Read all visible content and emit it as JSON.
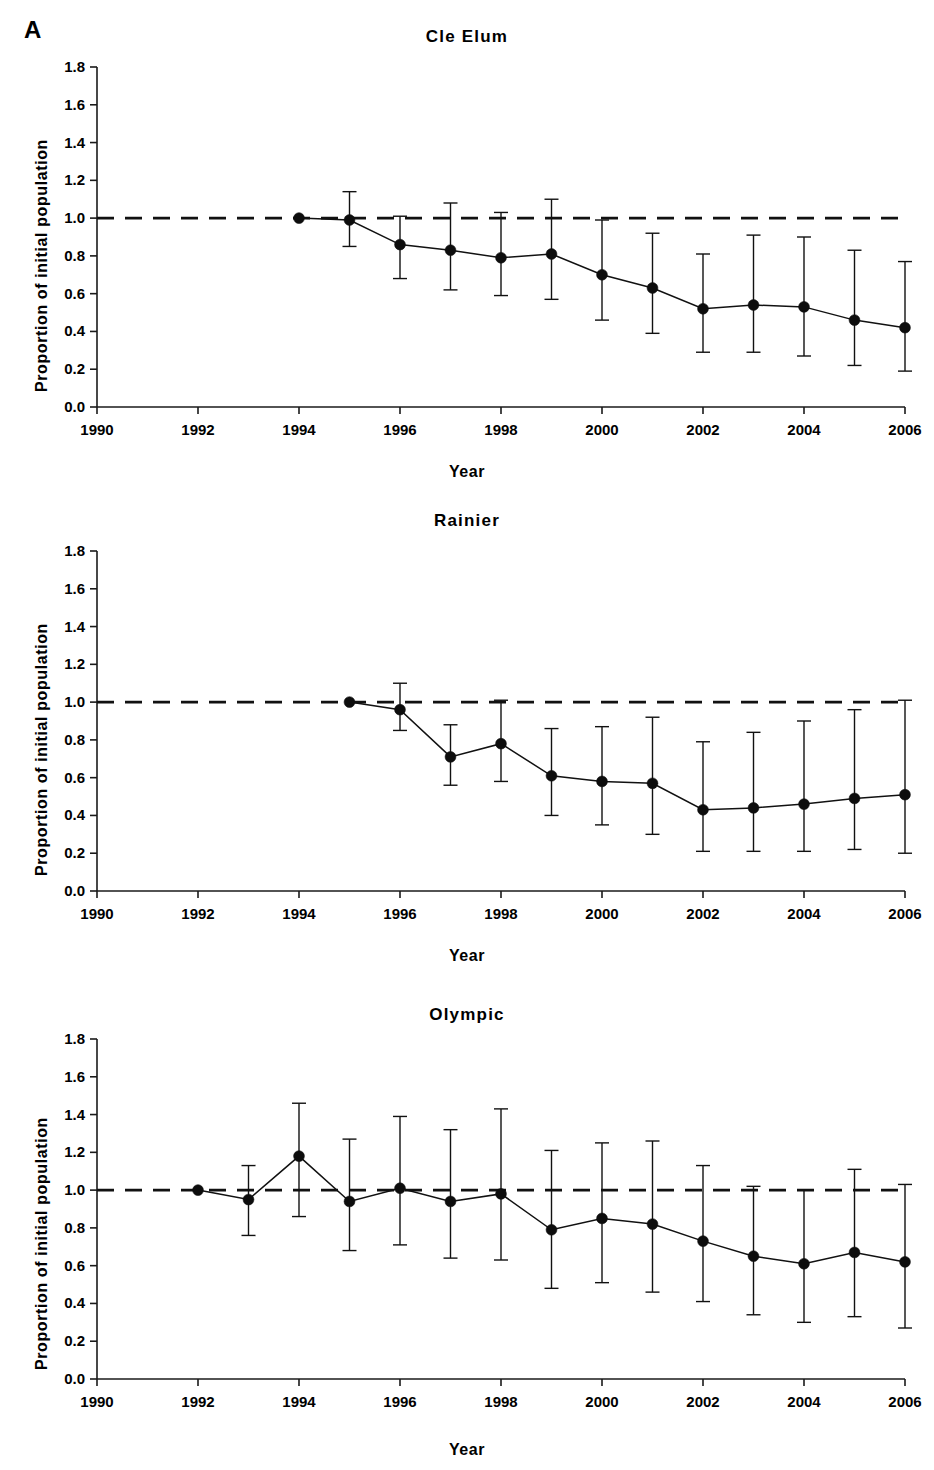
{
  "figure": {
    "panel_label": "A",
    "axis_titles": {
      "x": "Year",
      "y": "Proportion of initial population"
    },
    "y_ticks": [
      "0.0",
      "0.2",
      "0.4",
      "0.6",
      "0.8",
      "1.0",
      "1.2",
      "1.4",
      "1.6",
      "1.8"
    ],
    "x_ticks": [
      "1990",
      "1992",
      "1994",
      "1996",
      "1998",
      "2000",
      "2002",
      "2004",
      "2006"
    ],
    "reference_line_value": "1.0",
    "colors": {
      "ink": "#111111",
      "background": "#ffffff",
      "marker": "#0d0d0d"
    },
    "panels": [
      {
        "title": "Cle Elum"
      },
      {
        "title": "Rainier"
      },
      {
        "title": "Olympic"
      }
    ]
  },
  "chart_data": [
    {
      "type": "line",
      "title": "Cle Elum",
      "xlabel": "Year",
      "ylabel": "Proportion of initial population",
      "xlim": [
        1990,
        2006
      ],
      "ylim": [
        0.0,
        1.8
      ],
      "xticks": [
        1990,
        1992,
        1994,
        1996,
        1998,
        2000,
        2002,
        2004,
        2006
      ],
      "yticks": [
        0.0,
        0.2,
        0.4,
        0.6,
        0.8,
        1.0,
        1.2,
        1.4,
        1.6,
        1.8
      ],
      "grid": false,
      "legend": "none",
      "reference_line": {
        "y": 1.0,
        "style": "dashed"
      },
      "x": [
        1994,
        1995,
        1996,
        1997,
        1998,
        1999,
        2000,
        2001,
        2002,
        2003,
        2004,
        2005,
        2006
      ],
      "y": [
        1.0,
        0.99,
        0.86,
        0.83,
        0.79,
        0.81,
        0.7,
        0.63,
        0.52,
        0.54,
        0.53,
        0.46,
        0.42
      ],
      "y_err_low": [
        1.0,
        0.85,
        0.68,
        0.62,
        0.59,
        0.57,
        0.46,
        0.39,
        0.29,
        0.29,
        0.27,
        0.22,
        0.19
      ],
      "y_err_high": [
        1.0,
        1.14,
        1.01,
        1.08,
        1.03,
        1.1,
        0.99,
        0.92,
        0.81,
        0.91,
        0.9,
        0.83,
        0.77
      ]
    },
    {
      "type": "line",
      "title": "Rainier",
      "xlabel": "Year",
      "ylabel": "Proportion of initial population",
      "xlim": [
        1990,
        2006
      ],
      "ylim": [
        0.0,
        1.8
      ],
      "xticks": [
        1990,
        1992,
        1994,
        1996,
        1998,
        2000,
        2002,
        2004,
        2006
      ],
      "yticks": [
        0.0,
        0.2,
        0.4,
        0.6,
        0.8,
        1.0,
        1.2,
        1.4,
        1.6,
        1.8
      ],
      "grid": false,
      "legend": "none",
      "reference_line": {
        "y": 1.0,
        "style": "dashed"
      },
      "x": [
        1995,
        1996,
        1997,
        1998,
        1999,
        2000,
        2001,
        2002,
        2003,
        2004,
        2005,
        2006
      ],
      "y": [
        1.0,
        0.96,
        0.71,
        0.78,
        0.61,
        0.58,
        0.57,
        0.43,
        0.44,
        0.46,
        0.49,
        0.51
      ],
      "y_err_low": [
        1.0,
        0.85,
        0.56,
        0.58,
        0.4,
        0.35,
        0.3,
        0.21,
        0.21,
        0.21,
        0.22,
        0.2
      ],
      "y_err_high": [
        1.0,
        1.1,
        0.88,
        1.01,
        0.86,
        0.87,
        0.92,
        0.79,
        0.84,
        0.9,
        0.96,
        1.01
      ]
    },
    {
      "type": "line",
      "title": "Olympic",
      "xlabel": "Year",
      "ylabel": "Proportion of initial population",
      "xlim": [
        1990,
        2006
      ],
      "ylim": [
        0.0,
        1.8
      ],
      "xticks": [
        1990,
        1992,
        1994,
        1996,
        1998,
        2000,
        2002,
        2004,
        2006
      ],
      "yticks": [
        0.0,
        0.2,
        0.4,
        0.6,
        0.8,
        1.0,
        1.2,
        1.4,
        1.6,
        1.8
      ],
      "grid": false,
      "legend": "none",
      "reference_line": {
        "y": 1.0,
        "style": "dashed"
      },
      "x": [
        1992,
        1993,
        1994,
        1995,
        1996,
        1997,
        1998,
        1999,
        2000,
        2001,
        2002,
        2003,
        2004,
        2005,
        2006
      ],
      "y": [
        1.0,
        0.95,
        1.18,
        0.94,
        1.01,
        0.94,
        0.98,
        0.79,
        0.85,
        0.82,
        0.73,
        0.65,
        0.61,
        0.67,
        0.62
      ],
      "y_err_low": [
        1.0,
        0.76,
        0.86,
        0.68,
        0.71,
        0.64,
        0.63,
        0.48,
        0.51,
        0.46,
        0.41,
        0.34,
        0.3,
        0.33,
        0.27
      ],
      "y_err_high": [
        1.0,
        1.13,
        1.46,
        1.27,
        1.39,
        1.32,
        1.43,
        1.21,
        1.25,
        1.26,
        1.13,
        1.02,
        1.0,
        1.11,
        1.03
      ]
    }
  ]
}
